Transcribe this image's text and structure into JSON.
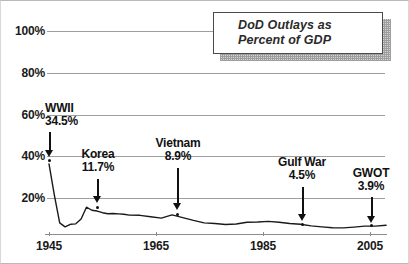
{
  "chart_data": {
    "type": "line",
    "title": "DoD Outlays as Percent of GDP",
    "title_lines": [
      "DoD Outlays as",
      "Percent of GDP"
    ],
    "xlabel": "",
    "ylabel": "",
    "xlim": [
      1945,
      2008
    ],
    "ylim": [
      0,
      100
    ],
    "xticks": [
      "1945",
      "1965",
      "1985",
      "2005"
    ],
    "xtick_values": [
      1945,
      1965,
      1985,
      2005
    ],
    "yticks": [
      "20%",
      "40%",
      "60%",
      "80%",
      "100%"
    ],
    "ytick_values": [
      20,
      40,
      60,
      80,
      100
    ],
    "grid": true,
    "legend": "none",
    "series": [
      {
        "name": "DoD Outlays as Percent of GDP",
        "x": [
          1945,
          1946,
          1947,
          1948,
          1949,
          1950,
          1951,
          1952,
          1953,
          1954,
          1955,
          1956,
          1957,
          1958,
          1959,
          1960,
          1962,
          1964,
          1966,
          1968,
          1970,
          1972,
          1974,
          1976,
          1978,
          1980,
          1982,
          1984,
          1986,
          1988,
          1990,
          1992,
          1994,
          1996,
          1998,
          2000,
          2002,
          2004,
          2006,
          2008
        ],
        "values": [
          34.5,
          19.2,
          5.5,
          3.5,
          4.8,
          5.0,
          7.4,
          13.2,
          11.7,
          11.3,
          10.5,
          10.0,
          10.1,
          9.9,
          9.7,
          9.3,
          9.2,
          8.5,
          7.8,
          9.4,
          8.1,
          6.7,
          5.5,
          5.2,
          4.7,
          4.9,
          5.8,
          5.9,
          6.2,
          5.8,
          5.2,
          4.8,
          4.0,
          3.5,
          3.1,
          3.0,
          3.4,
          3.9,
          3.9,
          4.3
        ]
      }
    ],
    "annotations": [
      {
        "label": "WWII",
        "value": "34.5%",
        "year": 1945,
        "point_pct": 34.5
      },
      {
        "label": "Korea",
        "value": "11.7%",
        "year": 1953,
        "point_pct": 11.7
      },
      {
        "label": "Vietnam",
        "value": "8.9%",
        "year": 1968,
        "point_pct": 8.9
      },
      {
        "label": "Gulf War",
        "value": "4.5%",
        "year": 1991,
        "point_pct": 4.5
      },
      {
        "label": "GWOT",
        "value": "3.9%",
        "year": 2005,
        "point_pct": 3.9
      }
    ],
    "colors": {
      "line": "#1a1a1a",
      "grid": "#9e9e9e",
      "text": "#1a1a1a",
      "title_text": "#2a2a2a",
      "box_border": "#4a4a4a",
      "shadow": "#8e8e8e"
    }
  }
}
